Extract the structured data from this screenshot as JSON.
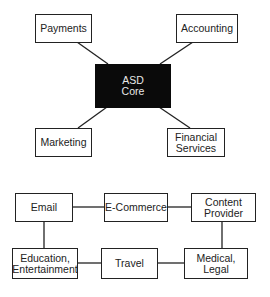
{
  "top_diagram": {
    "center": {
      "label": "ASD\nCore",
      "fill": "#0a0a0a",
      "text_color": "#e8e8e8"
    },
    "nodes": [
      {
        "id": "payments",
        "label": "Payments"
      },
      {
        "id": "accounting",
        "label": "Accounting"
      },
      {
        "id": "marketing",
        "label": "Marketing"
      },
      {
        "id": "financial-services",
        "label": "Financial\nServices"
      }
    ],
    "edges": [
      [
        "payments",
        "core"
      ],
      [
        "accounting",
        "core"
      ],
      [
        "core",
        "marketing"
      ],
      [
        "core",
        "financial-services"
      ]
    ]
  },
  "bottom_diagram": {
    "nodes": [
      {
        "id": "email",
        "label": "Email"
      },
      {
        "id": "e-commerce",
        "label": "E-Commerce"
      },
      {
        "id": "content-provider",
        "label": "Content\nProvider"
      },
      {
        "id": "education-entertainment",
        "label": "Education,\nEntertainment"
      },
      {
        "id": "travel",
        "label": "Travel"
      },
      {
        "id": "medical-legal",
        "label": "Medical,\nLegal"
      }
    ],
    "edges": [
      [
        "email",
        "e-commerce"
      ],
      [
        "e-commerce",
        "content-provider"
      ],
      [
        "email",
        "education-entertainment"
      ],
      [
        "content-provider",
        "medical-legal"
      ],
      [
        "education-entertainment",
        "travel"
      ],
      [
        "travel",
        "medical-legal"
      ]
    ]
  },
  "colors": {
    "stroke": "#222222",
    "background": "#ffffff"
  }
}
